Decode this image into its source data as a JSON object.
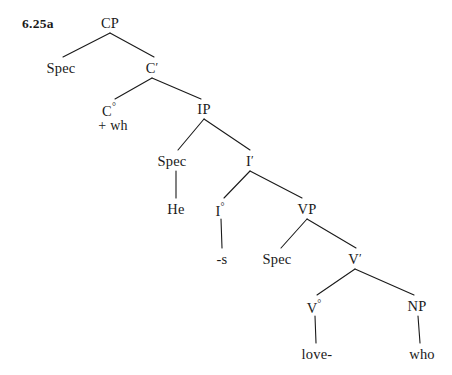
{
  "figure": {
    "number": "6.25a",
    "width": 452,
    "height": 375,
    "background": "#ffffff",
    "ink": "#1a1a1a"
  },
  "nodes": [
    {
      "id": "cp",
      "label": "CP",
      "sup": "",
      "prime": "",
      "x": 110,
      "y": 16,
      "kind": "phrase"
    },
    {
      "id": "spec_cp",
      "label": "Spec",
      "sup": "",
      "prime": "",
      "x": 61,
      "y": 61,
      "kind": "specifier"
    },
    {
      "id": "cbar",
      "label": "C",
      "sup": "",
      "prime": "′",
      "x": 152,
      "y": 61,
      "kind": "bar"
    },
    {
      "id": "c0",
      "label": "C",
      "sup": "°",
      "prime": "",
      "x": 109,
      "y": 102,
      "kind": "head"
    },
    {
      "id": "ip",
      "label": "IP",
      "sup": "",
      "prime": "",
      "x": 204,
      "y": 102,
      "kind": "phrase"
    },
    {
      "id": "spec_ip",
      "label": "Spec",
      "sup": "",
      "prime": "",
      "x": 172,
      "y": 154,
      "kind": "specifier"
    },
    {
      "id": "ibar",
      "label": "I",
      "sup": "",
      "prime": "′",
      "x": 250,
      "y": 154,
      "kind": "bar"
    },
    {
      "id": "he",
      "label": "He",
      "sup": "",
      "prime": "",
      "x": 176,
      "y": 202,
      "kind": "terminal"
    },
    {
      "id": "i0",
      "label": "I",
      "sup": "°",
      "prime": "",
      "x": 220,
      "y": 202,
      "kind": "head"
    },
    {
      "id": "vp",
      "label": "VP",
      "sup": "",
      "prime": "",
      "x": 307,
      "y": 202,
      "kind": "phrase"
    },
    {
      "id": "s_affix",
      "label": "-s",
      "sup": "",
      "prime": "",
      "x": 222,
      "y": 252,
      "kind": "terminal"
    },
    {
      "id": "spec_vp",
      "label": "Spec",
      "sup": "",
      "prime": "",
      "x": 277,
      "y": 252,
      "kind": "specifier"
    },
    {
      "id": "vbar",
      "label": "V",
      "sup": "",
      "prime": "′",
      "x": 355,
      "y": 252,
      "kind": "bar"
    },
    {
      "id": "v0",
      "label": "V",
      "sup": "°",
      "prime": "",
      "x": 314,
      "y": 299,
      "kind": "head"
    },
    {
      "id": "np",
      "label": "NP",
      "sup": "",
      "prime": "",
      "x": 417,
      "y": 299,
      "kind": "phrase"
    },
    {
      "id": "love",
      "label": "love-",
      "sup": "",
      "prime": "",
      "x": 317,
      "y": 347,
      "kind": "terminal"
    },
    {
      "id": "who",
      "label": "who",
      "sup": "",
      "prime": "",
      "x": 422,
      "y": 347,
      "kind": "terminal"
    }
  ],
  "feature_labels": [
    {
      "id": "wh_feature",
      "text": "+ wh",
      "x": 113,
      "y": 118
    }
  ],
  "edges": [
    {
      "id": "cp-spec",
      "from": "cp",
      "to": "spec_cp",
      "x1": 110,
      "y1": 33,
      "x2": 63,
      "y2": 57
    },
    {
      "id": "cp-cbar",
      "from": "cp",
      "to": "cbar",
      "x1": 110,
      "y1": 33,
      "x2": 154,
      "y2": 57
    },
    {
      "id": "cbar-c0",
      "from": "cbar",
      "to": "c0",
      "x1": 152,
      "y1": 78,
      "x2": 115,
      "y2": 99
    },
    {
      "id": "cbar-ip",
      "from": "cbar",
      "to": "ip",
      "x1": 152,
      "y1": 78,
      "x2": 201,
      "y2": 99
    },
    {
      "id": "ip-specip",
      "from": "ip",
      "to": "spec_ip",
      "x1": 204,
      "y1": 119,
      "x2": 178,
      "y2": 150
    },
    {
      "id": "ip-ibar",
      "from": "ip",
      "to": "ibar",
      "x1": 204,
      "y1": 119,
      "x2": 250,
      "y2": 150
    },
    {
      "id": "specip-he",
      "from": "spec_ip",
      "to": "he",
      "x1": 176,
      "y1": 171,
      "x2": 176,
      "y2": 198
    },
    {
      "id": "ibar-i0",
      "from": "ibar",
      "to": "i0",
      "x1": 250,
      "y1": 171,
      "x2": 224,
      "y2": 198
    },
    {
      "id": "ibar-vp",
      "from": "ibar",
      "to": "vp",
      "x1": 250,
      "y1": 171,
      "x2": 302,
      "y2": 198
    },
    {
      "id": "i0-s",
      "from": "i0",
      "to": "s_affix",
      "x1": 221,
      "y1": 219,
      "x2": 222,
      "y2": 248
    },
    {
      "id": "vp-specvp",
      "from": "vp",
      "to": "spec_vp",
      "x1": 307,
      "y1": 219,
      "x2": 281,
      "y2": 248
    },
    {
      "id": "vp-vbar",
      "from": "vp",
      "to": "vbar",
      "x1": 307,
      "y1": 219,
      "x2": 356,
      "y2": 248
    },
    {
      "id": "vbar-v0",
      "from": "vbar",
      "to": "v0",
      "x1": 355,
      "y1": 269,
      "x2": 317,
      "y2": 295
    },
    {
      "id": "vbar-np",
      "from": "vbar",
      "to": "np",
      "x1": 355,
      "y1": 269,
      "x2": 414,
      "y2": 295
    },
    {
      "id": "v0-love",
      "from": "v0",
      "to": "love",
      "x1": 315,
      "y1": 316,
      "x2": 316,
      "y2": 343
    },
    {
      "id": "np-who",
      "from": "np",
      "to": "who",
      "x1": 418,
      "y1": 316,
      "x2": 420,
      "y2": 343
    }
  ]
}
